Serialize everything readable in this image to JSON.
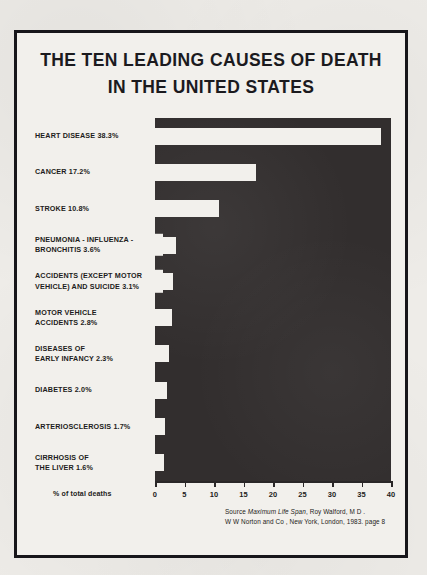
{
  "title": {
    "line1": "THE TEN LEADING CAUSES OF DEATH",
    "line2": "IN THE UNITED STATES"
  },
  "axis_caption": "% of total deaths",
  "source": {
    "line1_pre": "Source  ",
    "line1_italic": "Maximum Life Span",
    "line1_post": ", Roy Walford, M D .",
    "line2": "W W  Norton and Co , New York, London, 1983. page 8"
  },
  "chart_data": {
    "type": "bar",
    "orientation": "horizontal",
    "title": "THE TEN LEADING CAUSES OF DEATH IN THE UNITED STATES",
    "xlabel": "% of total deaths",
    "ylabel": "",
    "xlim": [
      0,
      40
    ],
    "xticks": [
      0,
      5,
      10,
      15,
      20,
      25,
      30,
      35,
      40
    ],
    "grid": false,
    "legend": false,
    "style_note": "negative-space: plot field solid dark, bars rendered as light cut-outs",
    "categories": [
      "HEART DISEASE",
      "CANCER",
      "STROKE",
      "PNEUMONIA - INFLUENZA - BRONCHITIS",
      "ACCIDENTS (EXCEPT MOTOR VEHICLE) AND SUICIDE",
      "MOTOR VEHICLE ACCIDENTS",
      "DISEASES OF EARLY INFANCY",
      "DIABETES",
      "ARTERIOSCLEROSIS",
      "CIRRHOSIS OF THE LIVER"
    ],
    "values": [
      38.3,
      17.2,
      10.8,
      3.6,
      3.1,
      2.8,
      2.3,
      2.0,
      1.7,
      1.6
    ],
    "bars": [
      {
        "label": "HEART DISEASE 38.3%",
        "label_lines": "HEART DISEASE 38.3%",
        "value": 38.3,
        "overflow": false
      },
      {
        "label": "CANCER 17.2%",
        "label_lines": "CANCER 17.2%",
        "value": 17.2,
        "overflow": false
      },
      {
        "label": "STROKE 10.8%",
        "label_lines": "STROKE 10.8%",
        "value": 10.8,
        "overflow": false
      },
      {
        "label": "PNEUMONIA - INFLUENZA - BRONCHITIS 3.6%",
        "label_lines": "PNEUMONIA - INFLUENZA -\nBRONCHITIS 3.6%",
        "value": 3.6,
        "overflow": true
      },
      {
        "label": "ACCIDENTS (EXCEPT MOTOR VEHICLE) AND SUICIDE 3.1%",
        "label_lines": "ACCIDENTS (EXCEPT MOTOR\nVEHICLE) AND SUICIDE 3.1%",
        "value": 3.1,
        "overflow": true
      },
      {
        "label": "MOTOR VEHICLE ACCIDENTS 2.8%",
        "label_lines": "MOTOR VEHICLE\nACCIDENTS 2.8%",
        "value": 2.8,
        "overflow": false
      },
      {
        "label": "DISEASES OF EARLY INFANCY 2.3%",
        "label_lines": "DISEASES OF\nEARLY INFANCY 2.3%",
        "value": 2.3,
        "overflow": false
      },
      {
        "label": "DIABETES 2.0%",
        "label_lines": "DIABETES 2.0%",
        "value": 2.0,
        "overflow": false
      },
      {
        "label": "ARTERIOSCLEROSIS 1.7%",
        "label_lines": "ARTERIOSCLEROSIS 1.7%",
        "value": 1.7,
        "overflow": false
      },
      {
        "label": "CIRRHOSIS OF THE LIVER 1.6%",
        "label_lines": "CIRRHOSIS OF\nTHE LIVER 1.6%",
        "value": 1.6,
        "overflow": false
      }
    ]
  },
  "colors": {
    "paper": "#eeece8",
    "panel": "#f2f0ec",
    "ink": "#1b1a1e",
    "plot_field": "#322e2e",
    "bar": "#f2f0ec"
  }
}
